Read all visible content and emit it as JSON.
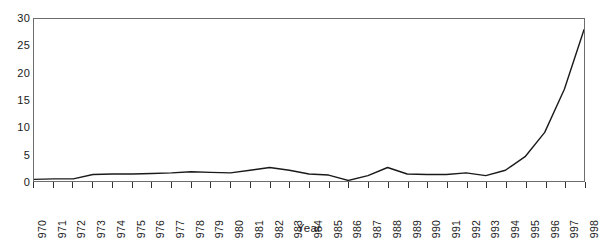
{
  "chart_data": {
    "type": "line",
    "title": "",
    "xlabel": "Year",
    "ylabel": "",
    "grid": false,
    "legend": "none",
    "xlim": [
      1970,
      1998
    ],
    "ylim": [
      0,
      30
    ],
    "yticks": [
      0,
      5,
      10,
      15,
      20,
      25,
      30
    ],
    "ytick_labels": [
      "0",
      "5",
      "10",
      "15",
      "20",
      "25",
      "30"
    ],
    "categories": [
      "1970",
      "1971",
      "1972",
      "1973",
      "1974",
      "1975",
      "1976",
      "1977",
      "1978",
      "1979",
      "1980",
      "1981",
      "1982",
      "1983",
      "1984",
      "1985",
      "1986",
      "1987",
      "1988",
      "1989",
      "1990",
      "1991",
      "1992",
      "1993",
      "1994",
      "1995",
      "1996",
      "1997",
      "1998"
    ],
    "values": [
      0.3,
      0.4,
      0.4,
      1.2,
      1.3,
      1.3,
      1.4,
      1.5,
      1.7,
      1.6,
      1.5,
      2.0,
      2.5,
      2.0,
      1.3,
      1.1,
      0.1,
      1.0,
      2.5,
      1.3,
      1.2,
      1.2,
      1.5,
      1.0,
      2.0,
      4.5,
      9.0,
      17.0,
      28.0
    ],
    "line_color": "#1a1a1a",
    "axis_color": "#6d6d6d",
    "background_color": "#ffffff"
  }
}
